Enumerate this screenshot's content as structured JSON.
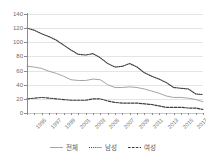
{
  "chart_data": {
    "type": "line",
    "title": "",
    "subtitle": "",
    "xlabel": "",
    "ylabel": "",
    "ylim": [
      0,
      140
    ],
    "yticks": [
      0,
      20,
      40,
      60,
      80,
      100,
      120,
      140
    ],
    "grid": true,
    "legend_position": "bottom",
    "x": [
      1995,
      1996,
      1997,
      1998,
      1999,
      2000,
      2001,
      2002,
      2003,
      2004,
      2005,
      2006,
      2007,
      2008,
      2009,
      2010,
      2011,
      2012,
      2013,
      2014,
      2015,
      2016,
      2017,
      2018,
      2019
    ],
    "tick_labels": [
      "1995",
      "1997",
      "1999",
      "2001",
      "2003",
      "2005",
      "2007",
      "2009",
      "2011",
      "2013",
      "2015",
      "2017",
      "2019"
    ],
    "series": [
      {
        "name": "전체",
        "style": "solid",
        "color": "#9a9a9a",
        "values": [
          66,
          65,
          63,
          59,
          56,
          52,
          47,
          46,
          46,
          48,
          47,
          40,
          36,
          36,
          37,
          36,
          34,
          31,
          28,
          24,
          22,
          22,
          21,
          19,
          16
        ]
      },
      {
        "name": "남성",
        "style": "dotted",
        "color": "#3d3d3d",
        "values": [
          120,
          117,
          112,
          108,
          103,
          96,
          89,
          83,
          82,
          84,
          78,
          70,
          65,
          66,
          70,
          65,
          57,
          52,
          48,
          43,
          36,
          35,
          34,
          27,
          26
        ]
      },
      {
        "name": "여성",
        "style": "dashed",
        "color": "#3d3d3d",
        "values": [
          20,
          21,
          22,
          21,
          20,
          19,
          18,
          18,
          18,
          20,
          20,
          17,
          15,
          14,
          14,
          14,
          13,
          12,
          10,
          8,
          8,
          8,
          7,
          7,
          5
        ]
      }
    ]
  },
  "legend": {
    "items": [
      {
        "label": "전체"
      },
      {
        "label": "남성"
      },
      {
        "label": "여성"
      }
    ]
  },
  "axis": {
    "y_tick_labels": [
      "140",
      "120",
      "100",
      "80",
      "60",
      "40",
      "20",
      "0"
    ]
  }
}
